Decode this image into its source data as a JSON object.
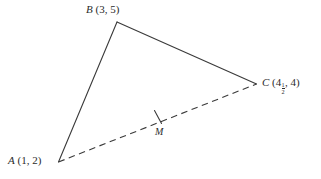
{
  "figure": {
    "type": "geometry-diagram",
    "background_color": "#ffffff",
    "stroke_color": "#3a3a3a",
    "text_color": "#2b2b2b"
  },
  "vertices": {
    "a": {
      "name": "A",
      "label": "A (1, 2)",
      "point_letter": "A",
      "coords_text": "(1, 2)",
      "x_value": "1",
      "y_value": "2"
    },
    "b": {
      "name": "B",
      "label": "B (3, 5)",
      "point_letter": "B",
      "coords_text": "(3, 5)",
      "x_value": "3",
      "y_value": "5"
    },
    "c": {
      "name": "C",
      "label": "C (4 1/2, 4)",
      "point_letter": "C",
      "open_paren": "(",
      "x_whole": "4",
      "x_frac_num": "1",
      "x_frac_den": "2",
      "comma": ", ",
      "y_value": "4",
      "close_paren": ")"
    },
    "m": {
      "name": "M",
      "label": "M"
    }
  },
  "segments": [
    {
      "name": "side-ab",
      "from": "A",
      "to": "B",
      "style": "solid"
    },
    {
      "name": "side-bc",
      "from": "B",
      "to": "C",
      "style": "solid"
    },
    {
      "name": "median-ac",
      "from": "A",
      "to": "C",
      "style": "dashed"
    }
  ],
  "marks": [
    {
      "name": "midpoint-tick",
      "on": "median-ac",
      "at": "M",
      "count": 1
    }
  ]
}
